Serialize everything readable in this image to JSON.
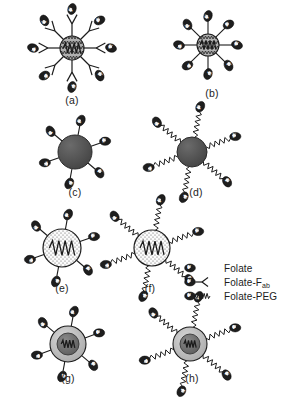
{
  "figure": {
    "panel_count": 8,
    "background_color": "#ffffff",
    "ink_color": "#1c1c1c"
  },
  "panels": [
    {
      "id": "a",
      "label": "(a)",
      "label_x": 72,
      "label_y": 104,
      "core_cx": 72,
      "core_cy": 48,
      "core_r": 12,
      "core_style": "hatched-zigzag",
      "core_fill": "#a8a8a8",
      "ligand_type": "Folate-Fab",
      "linker": "fab-y",
      "linker_length": 22,
      "ligand_count": 8
    },
    {
      "id": "b",
      "label": "(b)",
      "label_x": 212,
      "label_y": 97,
      "core_cx": 208,
      "core_cy": 45,
      "core_r": 11,
      "core_style": "hatched-zigzag",
      "core_fill": "#a8a8a8",
      "ligand_type": "Folate",
      "linker": "straight-short",
      "linker_length": 13,
      "ligand_count": 8
    },
    {
      "id": "c",
      "label": "(c)",
      "label_x": 75,
      "label_y": 196,
      "core_cx": 75,
      "core_cy": 152,
      "core_r": 17,
      "core_style": "solid",
      "core_fill": "#4f4f4f",
      "ligand_type": "Folate",
      "linker": "straight-short",
      "linker_length": 10,
      "ligand_count": 6
    },
    {
      "id": "d",
      "label": "(d)",
      "label_x": 196,
      "label_y": 196,
      "core_cx": 192,
      "core_cy": 152,
      "core_r": 15,
      "core_style": "solid",
      "core_fill": "#4f4f4f",
      "ligand_type": "Folate-PEG",
      "linker": "zigzag-peg",
      "linker_length": 26,
      "ligand_count": 6
    },
    {
      "id": "e",
      "label": "(e)",
      "label_x": 62,
      "label_y": 292,
      "core_cx": 62,
      "core_cy": 248,
      "core_r": 19,
      "core_style": "stippled-with-zigzag",
      "core_fill": "#f2f2f2",
      "ligand_type": "Folate",
      "linker": "straight-short",
      "linker_length": 10,
      "ligand_count": 6
    },
    {
      "id": "f",
      "label": "(f)",
      "label_x": 150,
      "label_y": 292,
      "core_cx": 152,
      "core_cy": 248,
      "core_r": 18,
      "core_style": "stippled-with-zigzag",
      "core_fill": "#f2f2f2",
      "ligand_type": "Folate-PEG",
      "linker": "zigzag-peg",
      "linker_length": 26,
      "ligand_count": 6
    },
    {
      "id": "g",
      "label": "(g)",
      "label_x": 68,
      "label_y": 382,
      "core_cx": 68,
      "core_cy": 344,
      "core_r": 18,
      "core_style": "core-shell",
      "core_fill": "#bdbdbd",
      "inner_fill": "#6e6e6e",
      "inner_r": 11,
      "ligand_type": "Folate",
      "linker": "straight-short",
      "linker_length": 10,
      "ligand_count": 6
    },
    {
      "id": "h",
      "label": "(h)",
      "label_x": 192,
      "label_y": 382,
      "core_cx": 190,
      "core_cy": 344,
      "core_r": 17,
      "core_style": "core-shell",
      "core_fill": "#bdbdbd",
      "inner_fill": "#6e6e6e",
      "inner_r": 10,
      "ligand_type": "Folate-PEG",
      "linker": "zigzag-peg",
      "linker_length": 26,
      "ligand_count": 6
    }
  ],
  "legend": {
    "x": 190,
    "y": 268,
    "items": [
      {
        "key": "folate",
        "label": "Folate",
        "sub": "",
        "icon": "folate-oval-icon"
      },
      {
        "key": "folate_fab",
        "label": "Folate-F",
        "sub": "ab",
        "icon": "folate-fab-icon"
      },
      {
        "key": "folate_peg",
        "label": "Folate-PEG",
        "sub": "",
        "icon": "folate-peg-icon"
      }
    ]
  },
  "glyphs": {
    "folate_letter": "F"
  }
}
